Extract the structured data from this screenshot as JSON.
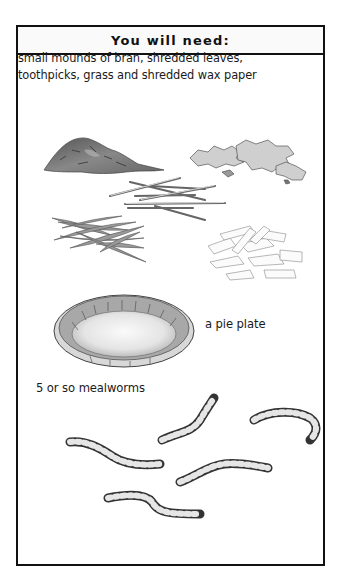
{
  "header": {
    "title": "You will need:"
  },
  "materials": {
    "description": "small mounds of bran, shredded leaves, toothpicks, grass and shredded wax paper",
    "line1": "small mounds of bran, shredded leaves,",
    "line2": "toothpicks, grass and shredded wax paper",
    "illustrations": [
      "bran-mound",
      "shredded-leaves",
      "toothpicks",
      "grass",
      "shredded-wax-paper"
    ]
  },
  "pie_plate": {
    "label": "a pie plate",
    "illustration": "pie-plate"
  },
  "mealworms": {
    "label": "5 or so mealworms",
    "count_illustrated": 5,
    "illustration": "mealworm"
  },
  "colors": {
    "border": "#111111",
    "header_bg": "#fafafa",
    "text": "#1a1a1a",
    "illustration_gray": "#777777"
  }
}
